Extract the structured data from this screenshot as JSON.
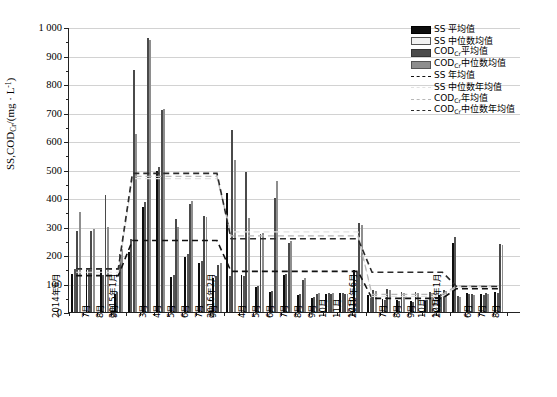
{
  "chart_data": {
    "type": "bar",
    "title": "",
    "xlabel": "",
    "ylabel": "SS,CODCr/(mg · L-1)",
    "ylim": [
      0,
      1000
    ],
    "ytick_step": 100,
    "grid": true,
    "legend_position": "top-right",
    "ytick_labels": [
      "0",
      "100",
      "200",
      "300",
      "400",
      "500",
      "600",
      "700",
      "800",
      "900",
      "1 000"
    ],
    "categories": [
      "2014年6月",
      "7月",
      "8月",
      "9月",
      "2015年1月",
      "3月",
      "4月",
      "5月",
      "6月",
      "7月",
      "9月",
      "2016年2月",
      "4月",
      "5月",
      "6月",
      "7月",
      "8月",
      "9月",
      "10月",
      "11月",
      "12月",
      "2019年6月",
      "7月",
      "8月",
      "9月",
      "10月",
      "12月",
      "2020年1月",
      "6月",
      "7月",
      "8月"
    ],
    "series": [
      {
        "name": "SS 平均值",
        "key": "ss_mean",
        "color": "#0d0d0d",
        "values": [
          133,
          148,
          155,
          62,
          210,
          368,
          495,
          123,
          193,
          172,
          121,
          417,
          130,
          88,
          70,
          130,
          60,
          50,
          63,
          67,
          148,
          58,
          45,
          42,
          38,
          40,
          58,
          243,
          65,
          62,
          70
        ]
      },
      {
        "name": "SS 中位数均值",
        "key": "ss_median",
        "color": "#ececec",
        "values": [
          152,
          150,
          130,
          70,
          255,
          387,
          508,
          130,
          205,
          180,
          127,
          128,
          126,
          92,
          72,
          133,
          62,
          52,
          65,
          68,
          140,
          50,
          43,
          40,
          36,
          42,
          62,
          262,
          62,
          60,
          68
        ]
      },
      {
        "name": "CODCr 平均值",
        "key": "cod_mean",
        "color": "#4a4a4a",
        "values": [
          283,
          283,
          410,
          203,
          848,
          960,
          710,
          328,
          380,
          338,
          165,
          640,
          493,
          272,
          400,
          243,
          112,
          62,
          63,
          63,
          312,
          78,
          82,
          70,
          70,
          70,
          77,
          55,
          62,
          65,
          238
        ]
      },
      {
        "name": "CODCr 中位数均值",
        "key": "cod_median",
        "color": "#8e8e8e",
        "values": [
          350,
          290,
          300,
          222,
          625,
          955,
          712,
          300,
          388,
          335,
          173,
          535,
          330,
          277,
          460,
          250,
          118,
          65,
          66,
          64,
          305,
          75,
          78,
          67,
          68,
          68,
          75,
          52,
          60,
          63,
          235
        ]
      }
    ],
    "reference_lines": [
      {
        "name": "SS 年均值",
        "key": "ss_year",
        "style": "dashed",
        "color": "#111111",
        "width": 1.6,
        "segments": [
          {
            "from": 0,
            "to": 3,
            "value": 128
          },
          {
            "from": 4,
            "to": 10,
            "value": 252
          },
          {
            "from": 11,
            "to": 20,
            "value": 143
          },
          {
            "from": 21,
            "to": 26,
            "value": 48
          },
          {
            "from": 27,
            "to": 30,
            "value": 82
          }
        ]
      },
      {
        "name": "SS 中位数年均值",
        "key": "ss_median_year",
        "style": "dashed",
        "color": "#e2e2e2",
        "width": 1.2,
        "segments": [
          {
            "from": 0,
            "to": 3,
            "value": 140
          },
          {
            "from": 4,
            "to": 10,
            "value": 470
          },
          {
            "from": 11,
            "to": 20,
            "value": 282
          },
          {
            "from": 21,
            "to": 26,
            "value": 55
          },
          {
            "from": 27,
            "to": 30,
            "value": 88
          }
        ]
      },
      {
        "name": "CODCr 年均值",
        "key": "cod_year",
        "style": "dashed",
        "color": "#b8b8b8",
        "width": 1.2,
        "segments": [
          {
            "from": 0,
            "to": 3,
            "value": 150
          },
          {
            "from": 4,
            "to": 10,
            "value": 478
          },
          {
            "from": 11,
            "to": 20,
            "value": 268
          },
          {
            "from": 21,
            "to": 26,
            "value": 62
          },
          {
            "from": 27,
            "to": 30,
            "value": 92
          }
        ]
      },
      {
        "name": "CODCr 中位数年均值",
        "key": "cod_median_year",
        "style": "dashed",
        "color": "#2b2b2b",
        "width": 1.6,
        "segments": [
          {
            "from": 0,
            "to": 3,
            "value": 152
          },
          {
            "from": 4,
            "to": 10,
            "value": 488
          },
          {
            "from": 11,
            "to": 20,
            "value": 258
          },
          {
            "from": 21,
            "to": 26,
            "value": 140
          },
          {
            "from": 27,
            "to": 30,
            "value": 90
          }
        ]
      }
    ]
  },
  "axis": {
    "y_title_main": "SS,COD",
    "y_title_sub": "Cr",
    "y_title_unit_open": "/(mg · L",
    "y_title_sup": "-1",
    "y_title_close": ")"
  },
  "legend": {
    "items": [
      {
        "label": "SS 平均值",
        "kind": "swatch",
        "swatch": "black"
      },
      {
        "label": "SS 中位数均值",
        "kind": "swatch",
        "swatch": "light"
      },
      {
        "label_pre": "COD",
        "label_sub": "Cr",
        "label_post": "平均值",
        "kind": "swatch",
        "swatch": "dark"
      },
      {
        "label_pre": "COD",
        "label_sub": "Cr",
        "label_post": "中位数均值",
        "kind": "swatch",
        "swatch": "mid"
      },
      {
        "label": "SS 年均值",
        "kind": "line",
        "line": "ss-year"
      },
      {
        "label": "SS 中位数年均值",
        "kind": "line",
        "line": "ss-median-year"
      },
      {
        "label_pre": "COD",
        "label_sub": "Cr",
        "label_post": "年均值",
        "kind": "line",
        "line": "cod-year"
      },
      {
        "label_pre": "COD",
        "label_sub": "Cr",
        "label_post": "中位数年均值",
        "kind": "line",
        "line": "cod-median-year"
      }
    ]
  }
}
